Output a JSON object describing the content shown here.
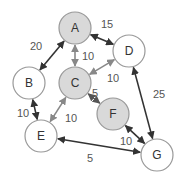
{
  "graph": {
    "nodes": [
      {
        "id": "A",
        "x": 75,
        "y": 28,
        "filled": true
      },
      {
        "id": "B",
        "x": 29,
        "y": 83,
        "filled": false
      },
      {
        "id": "C",
        "x": 75,
        "y": 83,
        "filled": true
      },
      {
        "id": "D",
        "x": 129,
        "y": 51,
        "filled": false
      },
      {
        "id": "E",
        "x": 41,
        "y": 136,
        "filled": false
      },
      {
        "id": "F",
        "x": 113,
        "y": 114,
        "filled": true
      },
      {
        "id": "G",
        "x": 157,
        "y": 155,
        "filled": false
      }
    ],
    "edges": [
      {
        "from": "A",
        "to": "B",
        "weight": "20",
        "color": "#333333",
        "lx": 30,
        "ly": 50
      },
      {
        "from": "A",
        "to": "C",
        "weight": "10",
        "color": "#888888",
        "lx": 82,
        "ly": 60
      },
      {
        "from": "A",
        "to": "D",
        "weight": "15",
        "color": "#333333",
        "lx": 101,
        "ly": 28
      },
      {
        "from": "C",
        "to": "D",
        "weight": "10",
        "color": "#888888",
        "lx": 107,
        "ly": 82
      },
      {
        "from": "C",
        "to": "F",
        "weight": "5",
        "color": "#555555",
        "lx": 92,
        "ly": 97
      },
      {
        "from": "C",
        "to": "E",
        "weight": "10",
        "color": "#888888",
        "lx": 65,
        "ly": 122
      },
      {
        "from": "B",
        "to": "E",
        "weight": "10",
        "color": "#333333",
        "lx": 17,
        "ly": 117
      },
      {
        "from": "D",
        "to": "G",
        "weight": "25",
        "color": "#333333",
        "lx": 153,
        "ly": 98
      },
      {
        "from": "F",
        "to": "G",
        "weight": "10",
        "color": "#333333",
        "lx": 120,
        "ly": 145
      },
      {
        "from": "G",
        "to": "E",
        "weight": "5",
        "color": "#333333",
        "lx": 87,
        "ly": 162
      }
    ]
  },
  "colors": {
    "node_fill": "#d9d9d9",
    "node_empty_fill": "#ffffff",
    "node_stroke": "#999999"
  }
}
